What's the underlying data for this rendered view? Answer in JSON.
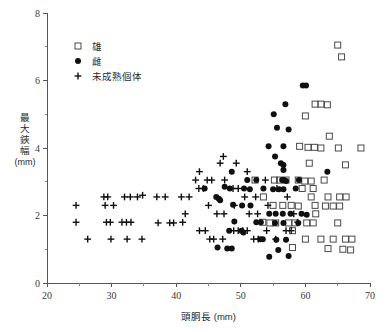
{
  "chart_data": {
    "type": "scatter",
    "title": "",
    "xlabel": "頭胴長 (mm)",
    "ylabel": "最大鋏幅 (mm)",
    "ylabel_chars": "最大鋏幅",
    "ylabel_unit": "(mm)",
    "xlim": [
      20,
      70
    ],
    "ylim": [
      0,
      8
    ],
    "x_ticks": [
      20,
      30,
      40,
      50,
      60,
      70
    ],
    "x_tick_labels": [
      "20",
      "30",
      "40",
      "50",
      "60",
      "70"
    ],
    "x_minor_ticks": [
      25,
      35,
      45,
      55,
      65
    ],
    "y_ticks": [
      0,
      2,
      4,
      6,
      8
    ],
    "y_tick_labels": [
      "0",
      "2",
      "4",
      "6",
      "8"
    ],
    "y_minor_ticks": [
      1,
      3,
      5,
      7
    ],
    "grid": false,
    "legend_position": "top-left-inside",
    "series": [
      {
        "name": "雄",
        "marker": "open-square",
        "color": "#4a4a4a",
        "points": [
          [
            65.0,
            7.05
          ],
          [
            65.6,
            6.7
          ],
          [
            61.5,
            5.3
          ],
          [
            62.4,
            5.3
          ],
          [
            63.4,
            5.28
          ],
          [
            60.0,
            4.95
          ],
          [
            63.7,
            4.35
          ],
          [
            59.1,
            4.05
          ],
          [
            60.4,
            4.02
          ],
          [
            61.4,
            4.02
          ],
          [
            62.4,
            4.0
          ],
          [
            65.1,
            4.0
          ],
          [
            68.6,
            4.0
          ],
          [
            60.6,
            3.55
          ],
          [
            66.2,
            3.5
          ],
          [
            55.2,
            3.05
          ],
          [
            57.0,
            3.05
          ],
          [
            58.9,
            3.05
          ],
          [
            59.9,
            3.02
          ],
          [
            60.9,
            3.02
          ],
          [
            62.9,
            3.05
          ],
          [
            59.5,
            2.8
          ],
          [
            61.2,
            2.8
          ],
          [
            60.9,
            2.55
          ],
          [
            63.5,
            2.55
          ],
          [
            65.3,
            2.55
          ],
          [
            66.3,
            2.55
          ],
          [
            55.0,
            2.3
          ],
          [
            56.5,
            2.3
          ],
          [
            57.8,
            2.3
          ],
          [
            58.9,
            2.28
          ],
          [
            61.5,
            2.3
          ],
          [
            63.1,
            2.28
          ],
          [
            64.3,
            2.28
          ],
          [
            65.3,
            2.28
          ],
          [
            61.6,
            2.05
          ],
          [
            53.4,
            1.8
          ],
          [
            54.5,
            1.78
          ],
          [
            55.4,
            1.78
          ],
          [
            57.4,
            1.78
          ],
          [
            58.4,
            1.78
          ],
          [
            60.2,
            1.78
          ],
          [
            61.2,
            1.78
          ],
          [
            65.0,
            1.78
          ],
          [
            58.0,
            1.55
          ],
          [
            60.0,
            1.3
          ],
          [
            62.4,
            1.3
          ],
          [
            64.3,
            1.3
          ],
          [
            66.2,
            1.3
          ],
          [
            67.2,
            1.3
          ],
          [
            58.0,
            1.05
          ],
          [
            63.5,
            1.02
          ],
          [
            65.8,
            1.0
          ],
          [
            67.0,
            0.98
          ],
          [
            52.2,
            3.05
          ],
          [
            53.5,
            2.55
          ],
          [
            56.0,
            3.05
          ]
        ]
      },
      {
        "name": "雌",
        "marker": "filled-circle",
        "color": "#101010",
        "points": [
          [
            59.6,
            5.85
          ],
          [
            60.1,
            5.85
          ],
          [
            56.9,
            5.3
          ],
          [
            55.1,
            5.0
          ],
          [
            55.6,
            4.6
          ],
          [
            57.4,
            4.55
          ],
          [
            54.3,
            4.05
          ],
          [
            56.6,
            4.05
          ],
          [
            55.3,
            3.75
          ],
          [
            56.2,
            3.55
          ],
          [
            56.6,
            3.5
          ],
          [
            56.6,
            3.35
          ],
          [
            48.6,
            3.3
          ],
          [
            51.0,
            3.05
          ],
          [
            52.4,
            3.05
          ],
          [
            56.4,
            3.05
          ],
          [
            56.7,
            3.05
          ],
          [
            57.0,
            3.02
          ],
          [
            59.0,
            3.05
          ],
          [
            63.4,
            3.3
          ],
          [
            44.4,
            2.8
          ],
          [
            47.5,
            2.85
          ],
          [
            48.3,
            2.8
          ],
          [
            50.5,
            2.8
          ],
          [
            51.4,
            2.78
          ],
          [
            53.5,
            2.8
          ],
          [
            55.0,
            2.78
          ],
          [
            55.9,
            2.78
          ],
          [
            56.6,
            2.78
          ],
          [
            58.5,
            2.8
          ],
          [
            46.2,
            2.55
          ],
          [
            46.6,
            2.5
          ],
          [
            46.8,
            2.45
          ],
          [
            48.8,
            2.32
          ],
          [
            50.2,
            2.3
          ],
          [
            51.5,
            2.3
          ],
          [
            54.4,
            2.05
          ],
          [
            55.4,
            2.05
          ],
          [
            56.5,
            2.05
          ],
          [
            57.7,
            2.05
          ],
          [
            59.4,
            2.05
          ],
          [
            60.2,
            2.02
          ],
          [
            49.0,
            1.82
          ],
          [
            52.4,
            1.8
          ],
          [
            53.1,
            1.8
          ],
          [
            55.3,
            1.78
          ],
          [
            56.6,
            1.78
          ],
          [
            58.9,
            1.78
          ],
          [
            48.2,
            1.55
          ],
          [
            50.1,
            1.55
          ],
          [
            50.4,
            1.5
          ],
          [
            53.0,
            1.3
          ],
          [
            53.4,
            1.3
          ],
          [
            55.5,
            1.28
          ],
          [
            57.0,
            1.28
          ],
          [
            46.4,
            1.05
          ],
          [
            47.9,
            1.02
          ],
          [
            48.6,
            1.02
          ],
          [
            55.8,
            0.98
          ],
          [
            57.4,
            0.8
          ],
          [
            54.4,
            0.78
          ]
        ]
      },
      {
        "name": "未成熟個体",
        "marker": "plus",
        "color": "#101010",
        "points": [
          [
            24.5,
            2.3
          ],
          [
            24.5,
            1.8
          ],
          [
            26.3,
            1.3
          ],
          [
            28.8,
            2.55
          ],
          [
            29.4,
            2.55
          ],
          [
            29.0,
            2.3
          ],
          [
            30.3,
            2.3
          ],
          [
            29.2,
            1.8
          ],
          [
            29.8,
            1.8
          ],
          [
            29.9,
            1.3
          ],
          [
            32.0,
            2.55
          ],
          [
            32.9,
            2.55
          ],
          [
            31.6,
            1.8
          ],
          [
            32.3,
            1.8
          ],
          [
            33.0,
            1.8
          ],
          [
            32.4,
            1.3
          ],
          [
            34.0,
            2.55
          ],
          [
            34.8,
            2.6
          ],
          [
            34.7,
            1.3
          ],
          [
            37.0,
            2.55
          ],
          [
            38.3,
            2.55
          ],
          [
            37.2,
            1.78
          ],
          [
            39.0,
            1.78
          ],
          [
            39.6,
            1.78
          ],
          [
            40.8,
            2.55
          ],
          [
            42.0,
            2.55
          ],
          [
            41.4,
            2.05
          ],
          [
            41.0,
            1.8
          ],
          [
            43.0,
            3.05
          ],
          [
            43.6,
            3.3
          ],
          [
            43.5,
            2.8
          ],
          [
            44.2,
            2.8
          ],
          [
            44.8,
            3.05
          ],
          [
            45.5,
            3.05
          ],
          [
            45.0,
            2.3
          ],
          [
            43.6,
            1.55
          ],
          [
            44.5,
            1.55
          ],
          [
            45.2,
            1.3
          ],
          [
            45.8,
            1.3
          ],
          [
            46.8,
            3.55
          ],
          [
            47.3,
            3.75
          ],
          [
            47.5,
            3.05
          ],
          [
            46.3,
            2.05
          ],
          [
            47.4,
            2.05
          ],
          [
            47.2,
            1.3
          ],
          [
            49.3,
            3.55
          ],
          [
            48.8,
            2.8
          ],
          [
            49.6,
            2.8
          ],
          [
            49.0,
            2.3
          ],
          [
            48.9,
            1.55
          ],
          [
            49.6,
            1.55
          ],
          [
            51.0,
            3.3
          ],
          [
            50.6,
            2.55
          ],
          [
            51.3,
            2.05
          ],
          [
            50.3,
            1.55
          ],
          [
            51.0,
            1.55
          ],
          [
            52.3,
            2.55
          ],
          [
            52.6,
            2.05
          ],
          [
            52.0,
            1.3
          ],
          [
            52.7,
            1.3
          ],
          [
            53.8,
            3.05
          ],
          [
            54.2,
            2.3
          ],
          [
            54.0,
            1.55
          ],
          [
            55.6,
            2.8
          ],
          [
            55.4,
            1.3
          ],
          [
            57.2,
            2.55
          ],
          [
            57.0,
            1.55
          ],
          [
            57.8,
            1.55
          ],
          [
            58.2,
            2.05
          ],
          [
            58.8,
            1.8
          ]
        ]
      }
    ]
  },
  "legend": {
    "items": [
      {
        "label": "雄",
        "marker": "open-square"
      },
      {
        "label": "雌",
        "marker": "filled-circle"
      },
      {
        "label": "未成熟個体",
        "marker": "plus"
      }
    ]
  },
  "axes": {
    "x_title": "頭胴長 (mm)",
    "y_title_chars": [
      "最",
      "大",
      "鋏",
      "幅"
    ],
    "y_title_unit": "(mm)"
  },
  "colors": {
    "axis": "#555555",
    "marker_open": "#4a4a4a",
    "marker_filled": "#101010",
    "background": "#ffffff"
  }
}
